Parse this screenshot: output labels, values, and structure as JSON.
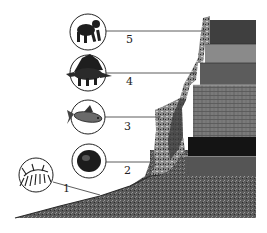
{
  "diagram": {
    "type": "fossil-strata",
    "colors": {
      "background": "#ffffff",
      "rock_dark": "#3a3a3a",
      "rock_mid": "#6e6e6e",
      "rock_light": "#9a9a9a",
      "coal_band": "#111111",
      "lines": "#333333"
    },
    "organisms": [
      {
        "number": "5",
        "icon": "ape-icon"
      },
      {
        "number": "4",
        "icon": "dinosaur-icon"
      },
      {
        "number": "3",
        "icon": "fish-icon"
      },
      {
        "number": "2",
        "icon": "shell-icon"
      },
      {
        "number": "1",
        "icon": "primitive-organism-icon"
      }
    ]
  }
}
